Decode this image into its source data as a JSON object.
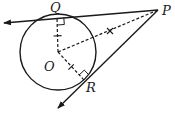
{
  "diagram": {
    "labels": {
      "P": "P",
      "Q": "Q",
      "O": "O",
      "R": "R"
    },
    "points": {
      "P": [
        158,
        10
      ],
      "Q": [
        57,
        18
      ],
      "O": [
        58,
        52
      ],
      "R": [
        84,
        80
      ]
    },
    "circle": {
      "center": "O",
      "radius": 38
    },
    "colors": {
      "stroke": "#1a1a1a",
      "background": "#ffffff"
    }
  }
}
